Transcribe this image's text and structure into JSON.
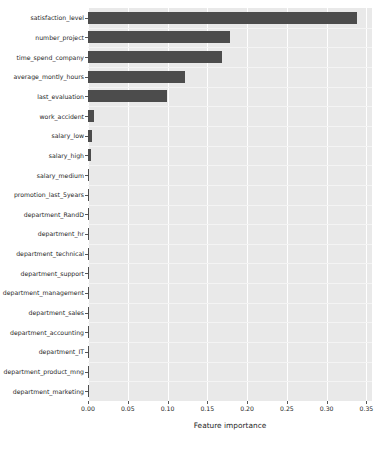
{
  "chart_data": {
    "type": "bar",
    "orientation": "horizontal",
    "title": "",
    "xlabel": "Feature importance",
    "ylabel": "",
    "xlim": [
      0.0,
      0.357
    ],
    "xticks": [
      "0.00",
      "0.05",
      "0.10",
      "0.15",
      "0.20",
      "0.25",
      "0.30",
      "0.35"
    ],
    "xtick_values": [
      0.0,
      0.05,
      0.1,
      0.15,
      0.2,
      0.25,
      0.3,
      0.35
    ],
    "grid": "vertical",
    "legend": "none",
    "bar_color": "#4c4c4c",
    "plot_background": "#e9e9e9",
    "figure_background": "#ffffff",
    "categories": [
      "satisfaction_level",
      "number_project",
      "time_spend_company",
      "average_montly_hours",
      "last_evaluation",
      "work_accident",
      "salary_low",
      "salary_high",
      "salary_medium",
      "promotion_last_5years",
      "department_RandD",
      "department_hr",
      "department_technical",
      "department_support",
      "department_management",
      "department_sales",
      "department_accounting",
      "department_IT",
      "department_product_mng",
      "department_marketing"
    ],
    "values": [
      0.338,
      0.178,
      0.168,
      0.122,
      0.099,
      0.0078,
      0.0045,
      0.0042,
      0.0013,
      0.0011,
      0.0009,
      0.0008,
      0.0007,
      0.0007,
      0.0006,
      0.0006,
      0.0005,
      0.0005,
      0.0004,
      0.0004
    ]
  }
}
